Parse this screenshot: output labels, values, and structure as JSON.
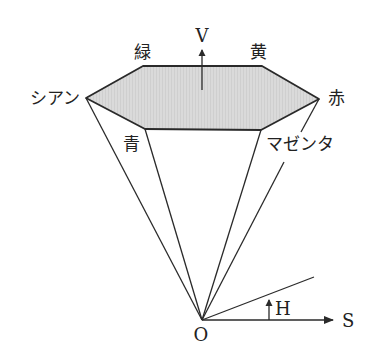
{
  "diagram": {
    "colors": {
      "stroke": "#2a2a2a",
      "hexagon_fill": "#d9d9d9",
      "background": "#ffffff"
    },
    "axes": {
      "v_label": "V",
      "h_label": "H",
      "s_label": "S",
      "origin_label": "O"
    },
    "vertices": {
      "cyan": "シアン",
      "green": "緑",
      "yellow": "黄",
      "red": "赤",
      "magenta": "マゼンタ",
      "blue": "青"
    }
  }
}
